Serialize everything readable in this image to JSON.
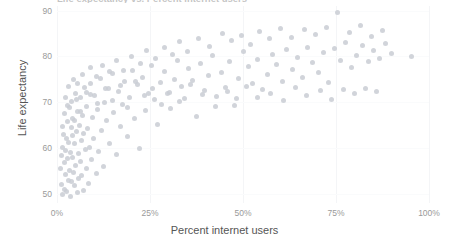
{
  "chart_data": {
    "type": "scatter",
    "title": "Life expectancy vs. Percent internet users",
    "xlabel": "Percent internet users",
    "ylabel": "Life expectancy",
    "xlim": [
      0,
      100
    ],
    "ylim": [
      48,
      91
    ],
    "grid": true,
    "legend": "none",
    "marker_color": "#c9ccd3",
    "xticks": [
      {
        "value": 0,
        "label": "0%"
      },
      {
        "value": 25,
        "label": "25%"
      },
      {
        "value": 50,
        "label": "50%"
      },
      {
        "value": 75,
        "label": "75%"
      },
      {
        "value": 100,
        "label": "100%"
      }
    ],
    "yticks": [
      {
        "value": 90,
        "label": "90"
      },
      {
        "value": 80,
        "label": "80"
      },
      {
        "value": 70,
        "label": "70"
      },
      {
        "value": 60,
        "label": "60"
      },
      {
        "value": 50,
        "label": "50"
      }
    ],
    "points": [
      [
        1.0,
        55.5
      ],
      [
        1.2,
        58.3
      ],
      [
        1.3,
        52.1
      ],
      [
        1.5,
        60.2
      ],
      [
        1.6,
        49.9
      ],
      [
        1.8,
        63.0
      ],
      [
        1.9,
        56.8
      ],
      [
        2.0,
        51.0
      ],
      [
        2.1,
        67.5
      ],
      [
        2.2,
        59.4
      ],
      [
        2.4,
        54.2
      ],
      [
        2.5,
        62.1
      ],
      [
        2.6,
        50.5
      ],
      [
        2.8,
        57.7
      ],
      [
        2.9,
        65.8
      ],
      [
        3.0,
        53.0
      ],
      [
        3.1,
        61.3
      ],
      [
        3.3,
        68.9
      ],
      [
        3.4,
        55.0
      ],
      [
        3.5,
        59.0
      ],
      [
        3.6,
        49.5
      ],
      [
        3.8,
        64.4
      ],
      [
        3.9,
        52.6
      ],
      [
        4.0,
        70.2
      ],
      [
        4.1,
        58.0
      ],
      [
        4.3,
        62.8
      ],
      [
        4.4,
        54.7
      ],
      [
        4.6,
        66.1
      ],
      [
        4.7,
        51.8
      ],
      [
        4.8,
        60.9
      ],
      [
        5.0,
        72.0
      ],
      [
        5.1,
        56.2
      ],
      [
        5.3,
        63.6
      ],
      [
        5.4,
        50.2
      ],
      [
        5.6,
        68.0
      ],
      [
        5.8,
        58.9
      ],
      [
        5.9,
        53.4
      ],
      [
        6.0,
        65.0
      ],
      [
        6.2,
        71.1
      ],
      [
        6.4,
        57.1
      ],
      [
        6.5,
        61.7
      ],
      [
        6.7,
        54.0
      ],
      [
        6.9,
        67.2
      ],
      [
        7.0,
        50.8
      ],
      [
        7.2,
        63.1
      ],
      [
        7.4,
        73.3
      ],
      [
        7.6,
        59.6
      ],
      [
        7.8,
        55.6
      ],
      [
        8.0,
        69.0
      ],
      [
        8.2,
        64.2
      ],
      [
        8.5,
        52.3
      ],
      [
        8.7,
        60.1
      ],
      [
        9.0,
        74.0
      ],
      [
        9.3,
        57.4
      ],
      [
        9.6,
        66.7
      ],
      [
        9.9,
        62.0
      ],
      [
        10.2,
        71.5
      ],
      [
        10.5,
        54.5
      ],
      [
        10.9,
        68.4
      ],
      [
        11.2,
        59.2
      ],
      [
        11.6,
        75.1
      ],
      [
        12.0,
        63.9
      ],
      [
        12.4,
        56.0
      ],
      [
        12.9,
        70.0
      ],
      [
        13.3,
        66.0
      ],
      [
        13.8,
        73.0
      ],
      [
        14.2,
        61.0
      ],
      [
        14.8,
        76.2
      ],
      [
        15.3,
        67.8
      ],
      [
        15.9,
        58.5
      ],
      [
        16.4,
        72.4
      ],
      [
        17.0,
        64.8
      ],
      [
        17.6,
        69.6
      ],
      [
        18.2,
        74.5
      ],
      [
        18.9,
        62.5
      ],
      [
        19.5,
        71.0
      ],
      [
        20.2,
        77.0
      ],
      [
        20.9,
        66.4
      ],
      [
        21.6,
        73.8
      ],
      [
        22.3,
        59.8
      ],
      [
        23.0,
        75.5
      ],
      [
        23.8,
        68.2
      ],
      [
        24.6,
        72.0
      ],
      [
        25.4,
        78.1
      ],
      [
        26.2,
        70.5
      ],
      [
        27.0,
        65.2
      ],
      [
        27.9,
        74.2
      ],
      [
        28.8,
        76.8
      ],
      [
        29.7,
        71.8
      ],
      [
        30.6,
        68.6
      ],
      [
        31.5,
        75.0
      ],
      [
        32.4,
        79.0
      ],
      [
        33.4,
        73.5
      ],
      [
        34.4,
        70.8
      ],
      [
        35.4,
        77.4
      ],
      [
        36.4,
        74.8
      ],
      [
        37.5,
        66.9
      ],
      [
        38.5,
        78.5
      ],
      [
        39.6,
        72.6
      ],
      [
        40.7,
        75.8
      ],
      [
        41.8,
        80.1
      ],
      [
        43.0,
        71.2
      ],
      [
        44.1,
        76.5
      ],
      [
        45.3,
        73.2
      ],
      [
        46.5,
        78.9
      ],
      [
        47.7,
        69.2
      ],
      [
        48.9,
        75.2
      ],
      [
        50.1,
        81.0
      ],
      [
        51.4,
        77.8
      ],
      [
        52.6,
        74.0
      ],
      [
        53.9,
        79.4
      ],
      [
        55.2,
        72.8
      ],
      [
        56.5,
        76.0
      ],
      [
        57.8,
        80.5
      ],
      [
        59.1,
        78.2
      ],
      [
        60.5,
        74.6
      ],
      [
        61.8,
        81.5
      ],
      [
        63.2,
        77.2
      ],
      [
        64.6,
        79.8
      ],
      [
        66.0,
        75.4
      ],
      [
        67.4,
        82.0
      ],
      [
        68.8,
        78.6
      ],
      [
        70.2,
        76.4
      ],
      [
        71.7,
        80.9
      ],
      [
        73.1,
        74.4
      ],
      [
        74.6,
        81.8
      ],
      [
        76.1,
        79.0
      ],
      [
        77.6,
        83.0
      ],
      [
        79.1,
        77.6
      ],
      [
        80.6,
        80.2
      ],
      [
        82.1,
        82.4
      ],
      [
        83.7,
        78.8
      ],
      [
        85.2,
        81.2
      ],
      [
        86.8,
        79.5
      ],
      [
        88.4,
        82.8
      ],
      [
        90.0,
        80.6
      ],
      [
        95.2,
        80.0
      ],
      [
        2.3,
        71.0
      ],
      [
        3.2,
        73.5
      ],
      [
        4.5,
        75.0
      ],
      [
        5.5,
        74.0
      ],
      [
        6.8,
        76.0
      ],
      [
        7.9,
        72.2
      ],
      [
        9.1,
        77.5
      ],
      [
        10.7,
        75.6
      ],
      [
        12.2,
        78.0
      ],
      [
        14.0,
        76.6
      ],
      [
        16.0,
        79.2
      ],
      [
        18.0,
        77.0
      ],
      [
        20.0,
        80.0
      ],
      [
        22.5,
        78.4
      ],
      [
        24.0,
        81.2
      ],
      [
        26.5,
        79.6
      ],
      [
        29.0,
        82.0
      ],
      [
        31.0,
        80.4
      ],
      [
        33.0,
        83.2
      ],
      [
        35.0,
        81.0
      ],
      [
        38.0,
        84.0
      ],
      [
        41.0,
        82.2
      ],
      [
        44.5,
        85.0
      ],
      [
        47.0,
        83.5
      ],
      [
        49.5,
        84.6
      ],
      [
        52.0,
        82.6
      ],
      [
        54.5,
        85.4
      ],
      [
        57.0,
        83.8
      ],
      [
        60.0,
        86.0
      ],
      [
        63.0,
        84.2
      ],
      [
        66.5,
        85.8
      ],
      [
        69.5,
        84.8
      ],
      [
        72.5,
        86.4
      ],
      [
        75.5,
        89.6
      ],
      [
        78.5,
        85.2
      ],
      [
        81.5,
        86.8
      ],
      [
        84.5,
        84.4
      ],
      [
        87.5,
        85.6
      ],
      [
        1.4,
        64.8
      ],
      [
        2.7,
        69.3
      ],
      [
        4.2,
        66.5
      ],
      [
        5.2,
        70.6
      ],
      [
        6.3,
        67.9
      ],
      [
        8.9,
        71.7
      ],
      [
        11.0,
        69.8
      ],
      [
        13.0,
        72.9
      ],
      [
        15.0,
        70.3
      ],
      [
        17.2,
        73.6
      ],
      [
        19.0,
        68.8
      ],
      [
        21.0,
        74.6
      ],
      [
        23.5,
        71.4
      ],
      [
        25.8,
        73.0
      ],
      [
        28.2,
        69.4
      ],
      [
        30.2,
        72.2
      ],
      [
        32.8,
        70.2
      ],
      [
        36.0,
        73.8
      ],
      [
        39.0,
        71.6
      ],
      [
        42.5,
        69.0
      ],
      [
        45.8,
        72.4
      ],
      [
        48.2,
        70.9
      ],
      [
        51.0,
        73.4
      ],
      [
        54.0,
        71.0
      ],
      [
        57.5,
        72.0
      ],
      [
        61.0,
        70.4
      ],
      [
        64.0,
        73.2
      ],
      [
        67.0,
        71.4
      ],
      [
        70.8,
        72.6
      ],
      [
        73.8,
        70.6
      ],
      [
        77.0,
        72.8
      ],
      [
        80.0,
        71.8
      ],
      [
        83.0,
        73.0
      ],
      [
        86.0,
        72.4
      ]
    ]
  }
}
